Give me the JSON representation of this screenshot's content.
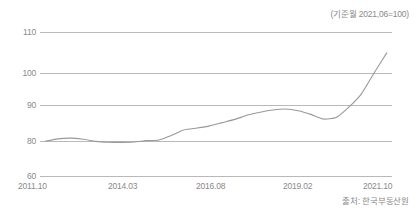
{
  "base_note": "(기준월 2021,06=100)",
  "source_note": "출처: 한국부동산원",
  "chart_data": {
    "type": "line",
    "title": "",
    "subtitle": "",
    "xlabel": "",
    "ylabel": "",
    "grid": true,
    "legend_position": "none",
    "line_color": "#999999",
    "grid_color": "#b9b9b9",
    "text_color": "#8a8a8a",
    "base_note": "(기준월 2021,06=100)",
    "source": "출처: 한국부동산원",
    "y_tick_labels": [
      "110",
      "100",
      "90",
      "80",
      "60"
    ],
    "y_tick_values": [
      110,
      100,
      90,
      80,
      60
    ],
    "y_axis_note": "non-linear spacing; 70 tick label omitted",
    "ylim": [
      60,
      112
    ],
    "x_tick_labels": [
      "2011.10",
      "2014.03",
      "2016.08",
      "2019.02",
      "2021.10"
    ],
    "x_tick_positions_pct": [
      2,
      27,
      52,
      76,
      99
    ],
    "x": [
      "2011.10",
      "2012.02",
      "2012.06",
      "2012.10",
      "2013.02",
      "2013.06",
      "2013.10",
      "2014.03",
      "2014.08",
      "2015.01",
      "2015.06",
      "2015.11",
      "2016.04",
      "2016.08",
      "2017.01",
      "2017.06",
      "2017.11",
      "2018.04",
      "2018.09",
      "2019.02",
      "2019.07",
      "2019.12",
      "2020.05",
      "2020.08",
      "2020.11",
      "2021.02",
      "2021.06",
      "2021.10"
    ],
    "values": [
      79.9,
      80.6,
      80.8,
      80.5,
      79.8,
      79.3,
      79.2,
      79.4,
      80.1,
      80.3,
      81.6,
      83.1,
      83.6,
      84.2,
      85.1,
      86.0,
      87.2,
      88.0,
      88.6,
      88.9,
      88.4,
      87.4,
      86.1,
      86.5,
      89.4,
      93.5,
      100.0,
      104.9
    ],
    "annotations": []
  }
}
